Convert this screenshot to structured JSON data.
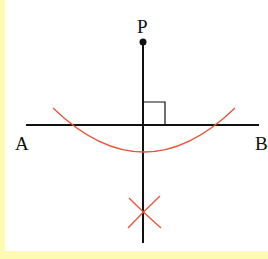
{
  "diagram": {
    "labels": {
      "point_p": "P",
      "point_a": "A",
      "point_b": "B"
    },
    "colors": {
      "line": "#111111",
      "arc": "#e8553a",
      "border": "#fdfbb0",
      "background": "#ffffff"
    },
    "elements": {
      "line_ab": {
        "x1": 26,
        "y1": 125,
        "x2": 259,
        "y2": 125
      },
      "perpendicular": {
        "x1": 143,
        "y1": 42,
        "x2": 143,
        "y2": 243
      },
      "point_p": {
        "cx": 143,
        "cy": 42,
        "r": 3.5
      },
      "right_angle_marker": {
        "x": 143,
        "y": 102,
        "size": 22
      },
      "main_arc": {
        "start": [
          53,
          108
        ],
        "end": [
          235,
          108
        ],
        "bottom_y": 151
      },
      "intersection_arcs": {
        "center": [
          143,
          214
        ]
      }
    }
  }
}
